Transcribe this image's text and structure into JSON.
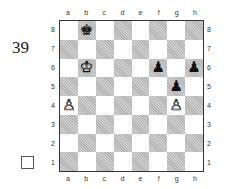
{
  "diagram": {
    "number": "39",
    "to_move_indicator": "white-to-move-box",
    "files": [
      "a",
      "b",
      "c",
      "d",
      "e",
      "f",
      "g",
      "h"
    ],
    "ranks": [
      "8",
      "7",
      "6",
      "5",
      "4",
      "3",
      "2",
      "1"
    ],
    "pieces": [
      {
        "square": "b8",
        "piece": "king",
        "color": "black",
        "glyph": "♚"
      },
      {
        "square": "b6",
        "piece": "king",
        "color": "white",
        "glyph": "♔"
      },
      {
        "square": "a4",
        "piece": "pawn",
        "color": "white",
        "glyph": "♙"
      },
      {
        "square": "g4",
        "piece": "pawn",
        "color": "white",
        "glyph": "♙"
      },
      {
        "square": "f6",
        "piece": "pawn",
        "color": "black",
        "glyph": "♟"
      },
      {
        "square": "h6",
        "piece": "pawn",
        "color": "black",
        "glyph": "♟"
      },
      {
        "square": "g5",
        "piece": "pawn",
        "color": "black",
        "glyph": "♟"
      }
    ],
    "colors": {
      "dark_square": "#b4b4b4",
      "light_square": "#ffffff",
      "border": "#333333"
    }
  }
}
